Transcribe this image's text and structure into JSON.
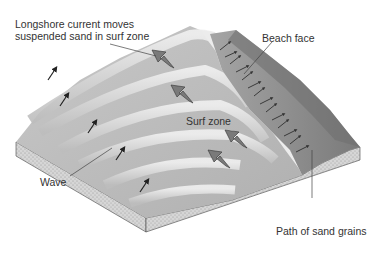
{
  "diagram": {
    "labels": {
      "longshore_line1": "Longshore current moves",
      "longshore_line2": "suspended sand in surf zone",
      "beach_face": "Beach face",
      "surf_zone": "Surf zone",
      "wave": "Wave",
      "sand_path": "Path of sand grains"
    },
    "colors": {
      "water_light": "#e2e2e2",
      "water_dark": "#b8b8b8",
      "beach": "#8f8f8f",
      "beach_dark": "#6f6f6f",
      "sediment": "#d4d4d4",
      "arrow_current": "#7a7a7a",
      "arrow_wave": "#222222",
      "leader": "#444444"
    },
    "elements": [
      {
        "name": "wave-crests",
        "count": 6
      },
      {
        "name": "wave-direction-arrows",
        "count": 6
      },
      {
        "name": "longshore-current-arrows",
        "count": 4
      },
      {
        "name": "swash-backwash-arrows",
        "count": 14
      }
    ]
  }
}
